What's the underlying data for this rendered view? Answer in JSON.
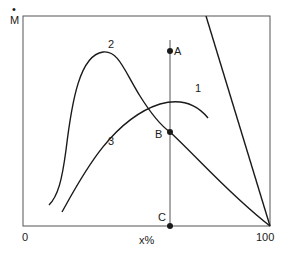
{
  "diagram": {
    "y_axis_label": "M",
    "y_axis_label_dot": "•",
    "x_axis_label": "x%",
    "x_tick_min": "0",
    "x_tick_max": "100",
    "curves": [
      {
        "id": "1",
        "label": "1",
        "type": "straight line"
      },
      {
        "id": "2",
        "label": "2",
        "type": "peaked curve"
      },
      {
        "id": "3",
        "label": "3",
        "type": "broad curve"
      }
    ],
    "points": [
      {
        "label": "A",
        "on": "line 1"
      },
      {
        "label": "B",
        "on": "curve 2"
      },
      {
        "label": "C",
        "on": "x-axis"
      }
    ],
    "colors": {
      "stroke": "#1a1a1a",
      "frame": "#555555",
      "background": "#ffffff"
    }
  }
}
